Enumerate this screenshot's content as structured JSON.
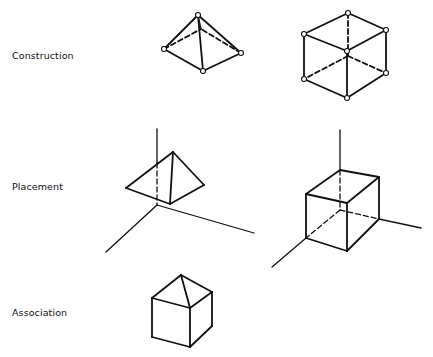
{
  "rows": [
    {
      "label": "Construction"
    },
    {
      "label": "Placement"
    },
    {
      "label": "Association"
    }
  ],
  "figures": {
    "construction": [
      "pyramid-with-vertex-nodes",
      "cube-with-vertex-nodes"
    ],
    "placement": [
      "pyramid-on-axes",
      "cube-on-axes"
    ],
    "association": [
      "cube-with-pyramid-roof"
    ]
  }
}
